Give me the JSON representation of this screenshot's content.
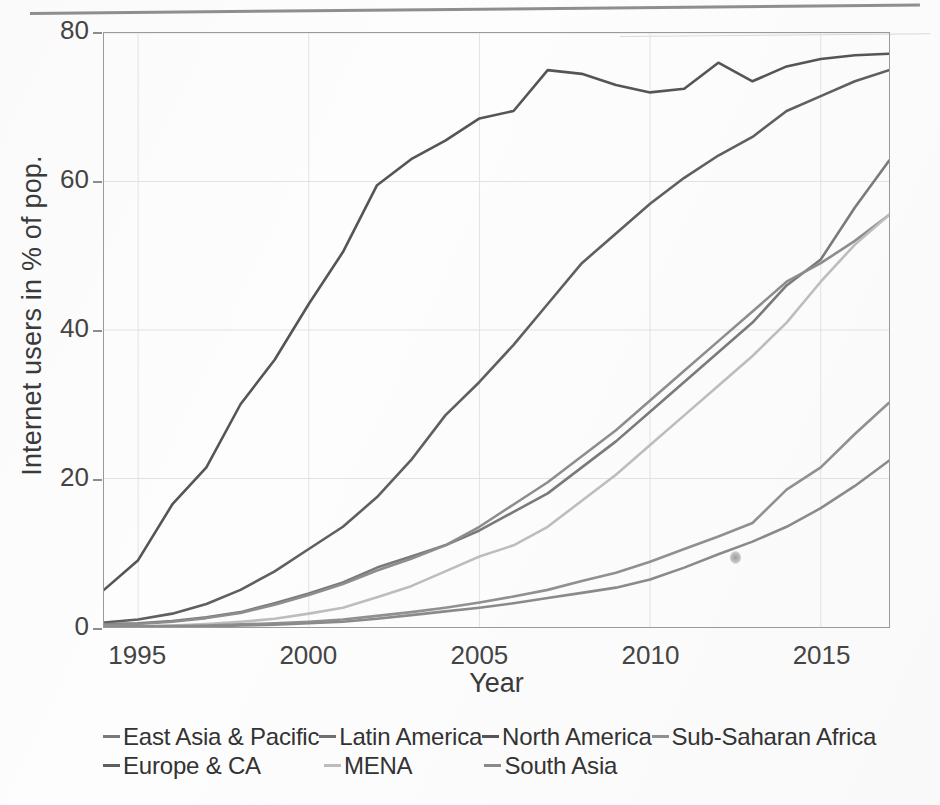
{
  "chart_data": {
    "type": "line",
    "title": "",
    "xlabel": "Year",
    "ylabel": "Internet users in % of pop.",
    "xlim": [
      1994,
      2017
    ],
    "ylim": [
      0,
      80
    ],
    "xticks": [
      1995,
      2000,
      2005,
      2010,
      2015
    ],
    "yticks": [
      0,
      20,
      40,
      60,
      80
    ],
    "grid": true,
    "legend_position": "bottom",
    "x": [
      1994,
      1995,
      1996,
      1997,
      1998,
      1999,
      2000,
      2001,
      2002,
      2003,
      2004,
      2005,
      2006,
      2007,
      2008,
      2009,
      2010,
      2011,
      2012,
      2013,
      2014,
      2015,
      2016,
      2017
    ],
    "series": [
      {
        "name": "North America",
        "color": "#555555",
        "values": [
          5.0,
          9.0,
          16.5,
          21.5,
          30.0,
          36.0,
          43.5,
          50.5,
          59.5,
          63.0,
          65.5,
          68.5,
          69.5,
          75.0,
          74.5,
          73.0,
          72.0,
          72.5,
          76.0,
          73.5,
          75.5,
          76.5,
          77.0,
          77.2
        ]
      },
      {
        "name": "Europe & CA",
        "color": "#5f5f5f",
        "values": [
          0.6,
          1.0,
          1.8,
          3.1,
          5.0,
          7.5,
          10.5,
          13.5,
          17.5,
          22.5,
          28.5,
          33.0,
          38.0,
          43.5,
          49.0,
          53.0,
          57.0,
          60.5,
          63.5,
          66.0,
          69.5,
          71.5,
          73.5,
          75.0
        ]
      },
      {
        "name": "East Asia & Pacific",
        "color": "#7a7a7a",
        "values": [
          0.4,
          0.5,
          0.8,
          1.3,
          2.0,
          3.2,
          4.5,
          6.0,
          8.0,
          9.5,
          11.0,
          13.0,
          15.5,
          18.0,
          21.5,
          25.0,
          29.0,
          33.0,
          37.0,
          41.0,
          46.0,
          49.5,
          56.5,
          62.8
        ]
      },
      {
        "name": "Latin America",
        "color": "#8d8d8d",
        "values": [
          0.3,
          0.4,
          0.7,
          1.2,
          1.9,
          3.0,
          4.3,
          5.8,
          7.6,
          9.2,
          11.0,
          13.5,
          16.5,
          19.5,
          23.0,
          26.5,
          30.5,
          34.5,
          38.5,
          42.5,
          46.5,
          49.0,
          52.0,
          55.5
        ]
      },
      {
        "name": "MENA",
        "color": "#bdbdbd",
        "values": [
          0.05,
          0.1,
          0.2,
          0.4,
          0.7,
          1.1,
          1.8,
          2.6,
          4.0,
          5.5,
          7.5,
          9.5,
          11.0,
          13.5,
          17.0,
          20.5,
          24.5,
          28.5,
          32.5,
          36.5,
          41.0,
          46.5,
          51.5,
          55.5
        ]
      },
      {
        "name": "Sub-Saharan Africa",
        "color": "#909090",
        "values": [
          0.05,
          0.08,
          0.12,
          0.2,
          0.35,
          0.5,
          0.7,
          1.0,
          1.5,
          2.0,
          2.6,
          3.3,
          4.1,
          5.0,
          6.2,
          7.3,
          8.8,
          10.5,
          12.2,
          14.0,
          18.5,
          21.5,
          26.0,
          30.2
        ]
      },
      {
        "name": "South Asia",
        "color": "#8a8a8a",
        "values": [
          0.02,
          0.04,
          0.06,
          0.1,
          0.2,
          0.3,
          0.5,
          0.7,
          1.1,
          1.6,
          2.1,
          2.6,
          3.2,
          3.9,
          4.6,
          5.3,
          6.4,
          8.0,
          9.8,
          11.5,
          13.5,
          16.0,
          19.0,
          22.4
        ]
      }
    ]
  },
  "axes": {
    "y_title": "Internet users in % of pop.",
    "x_title": "Year",
    "y_tick_labels": [
      "80",
      "60",
      "40",
      "20",
      "0"
    ],
    "x_tick_labels": [
      "1995",
      "2000",
      "2005",
      "2010",
      "2015"
    ]
  },
  "legend": {
    "row1": [
      {
        "label": "East Asia & Pacific",
        "color": "#7a7a7a"
      },
      {
        "label": "Latin America",
        "color": "#6f6f6f"
      },
      {
        "label": "North America",
        "color": "#555555"
      },
      {
        "label": "Sub-Saharan Africa",
        "color": "#909090"
      }
    ],
    "row2": [
      {
        "label": "Europe & CA",
        "color": "#5f5f5f"
      },
      {
        "label": "MENA",
        "color": "#bdbdbd"
      },
      {
        "label": "South Asia",
        "color": "#8a8a8a"
      }
    ]
  }
}
